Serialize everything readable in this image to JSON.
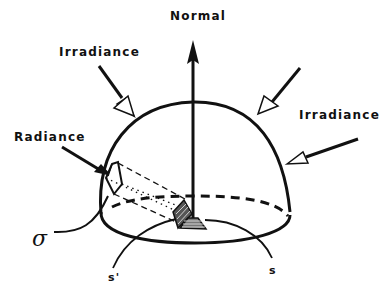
{
  "figure": {
    "type": "hemisphere irradiance/radiance schematic",
    "background": "#ffffff",
    "ink_color": "#111111"
  },
  "labels": {
    "normal": "Normal",
    "irradiance_left": "Irradiance",
    "irradiance_right": "Irradiance",
    "radiance": "Radiance",
    "sigma": "σ",
    "s_prime": "s'",
    "s": "s"
  },
  "elements": {
    "hemisphere": "dome with solid upper outline and dashed back base edge",
    "normal_arrow": "vertical solid arrow from surface element upward",
    "irradiance_arrows": 3,
    "radiance_arrow": 1,
    "beam": "dashed/dotted projection from surface patch to aperture sigma",
    "surface_elements": [
      "s'",
      "s"
    ]
  }
}
